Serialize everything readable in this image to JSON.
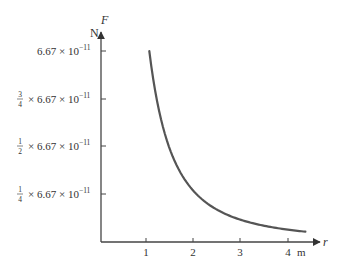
{
  "chart_data": {
    "type": "line",
    "title": "",
    "xlabel": "r",
    "xunit": "m",
    "ylabel": "F",
    "yunit": "N",
    "x_ticks": [
      "1",
      "2",
      "3",
      "4"
    ],
    "y_ticks": [
      {
        "frac_num": "1",
        "frac_den": "4",
        "label": "× 6.67 × 10",
        "exp": "−11",
        "value": 1.6675e-11
      },
      {
        "frac_num": "1",
        "frac_den": "2",
        "label": "× 6.67 × 10",
        "exp": "−11",
        "value": 3.335e-11
      },
      {
        "frac_num": "3",
        "frac_den": "4",
        "label": "× 6.67 × 10",
        "exp": "−11",
        "value": 5.0025e-11
      },
      {
        "frac_num": "",
        "frac_den": "",
        "label": "6.67 × 10",
        "exp": "−11",
        "value": 6.67e-11
      }
    ],
    "series": [
      {
        "name": "F = 6.67e-11 / r^2",
        "x": [
          1.0,
          1.1,
          1.2,
          1.3,
          1.4,
          1.5,
          1.75,
          2.0,
          2.5,
          3.0,
          3.5,
          4.0,
          4.3
        ],
        "values": [
          6.67e-11,
          5.51e-11,
          4.63e-11,
          3.95e-11,
          3.4e-11,
          2.96e-11,
          2.18e-11,
          1.67e-11,
          1.07e-11,
          7.41e-12,
          5.44e-12,
          4.17e-12,
          3.61e-12
        ]
      }
    ],
    "xlim": [
      0,
      4.5
    ],
    "ylim": [
      0,
      7.2e-11
    ],
    "grid": false,
    "legend": "none",
    "color": "#555555"
  },
  "axes": {
    "y_unit": "N",
    "y_name": "F",
    "x_unit": "m",
    "x_name": "r"
  }
}
